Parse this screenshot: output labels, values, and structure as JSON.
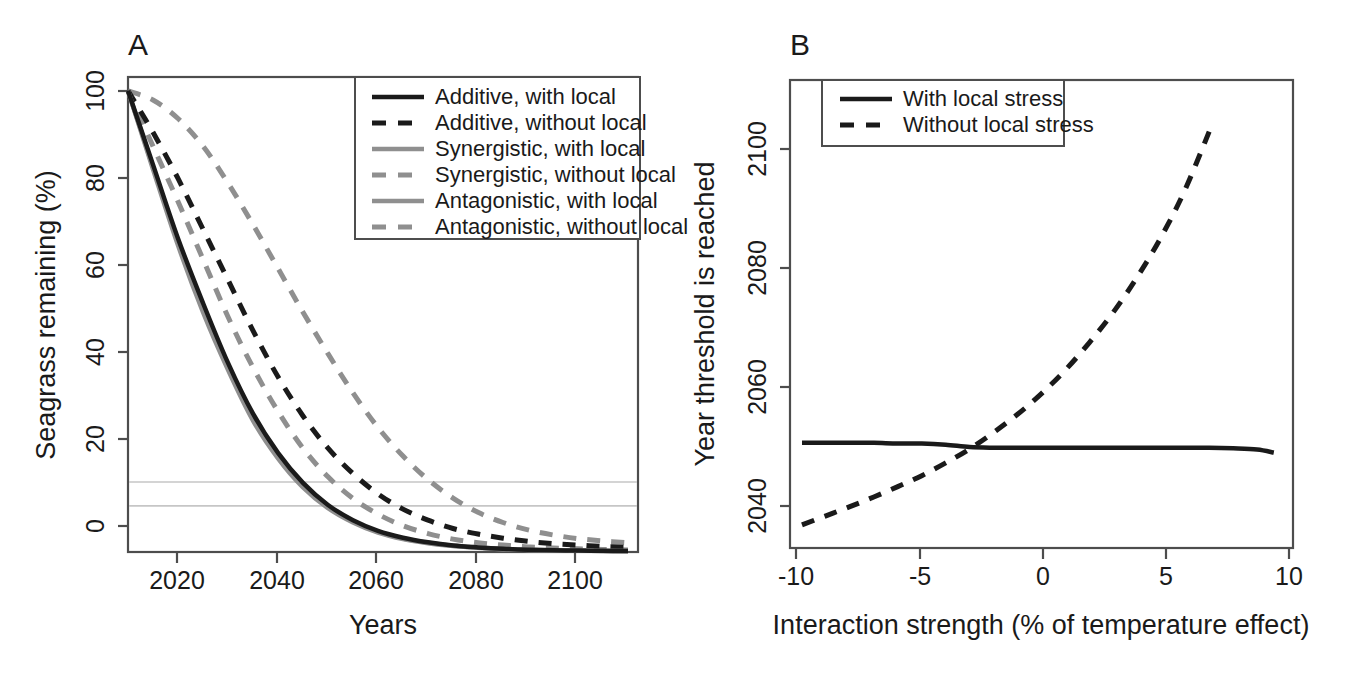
{
  "figure": {
    "background": "#ffffff",
    "colors": {
      "black": "#1a1a1a",
      "gray_dark": "#6e6e6e",
      "gray_light": "#8f8f8f",
      "axis": "#4d4d4d",
      "threshold_line": "#c6c6c6"
    }
  },
  "panelA": {
    "label": "A",
    "xlabel": "Years",
    "ylabel": "Seagrass remaining (%)",
    "xticks": [
      "2020",
      "2040",
      "2060",
      "2080",
      "2100"
    ],
    "yticks": [
      "0",
      "20",
      "40",
      "60",
      "80",
      "100"
    ],
    "legend": {
      "items": [
        {
          "label": "Additive, with local",
          "style": "solid",
          "color": "#1a1a1a"
        },
        {
          "label": "Additive, without local",
          "style": "dashed",
          "color": "#1a1a1a"
        },
        {
          "label": "Synergistic, with local",
          "style": "solid",
          "color": "#8f8f8f"
        },
        {
          "label": "Synergistic, without local",
          "style": "dashed",
          "color": "#8f8f8f"
        },
        {
          "label": "Antagonistic, with local",
          "style": "solid",
          "color": "#8f8f8f"
        },
        {
          "label": "Antagonistic, without local",
          "style": "dashed",
          "color": "#8f8f8f"
        }
      ]
    },
    "threshold": {
      "value": 10,
      "label": "10% threshold"
    }
  },
  "panelB": {
    "label": "B",
    "xlabel": "Interaction strength (% of temperature effect)",
    "ylabel": "Year threshold is reached",
    "xticks": [
      "-10",
      "-5",
      "0",
      "5",
      "10"
    ],
    "yticks": [
      "2040",
      "2060",
      "2080",
      "2100"
    ],
    "legend": {
      "items": [
        {
          "label": "With local stress",
          "style": "solid",
          "color": "#1a1a1a"
        },
        {
          "label": "Without local stress",
          "style": "dashed",
          "color": "#1a1a1a"
        }
      ]
    }
  },
  "chart_data": [
    {
      "type": "line",
      "panel": "A",
      "title": "",
      "xlabel": "Years",
      "ylabel": "Seagrass remaining (%)",
      "xlim": [
        2010,
        2112
      ],
      "ylim": [
        0,
        103
      ],
      "xticks": [
        2020,
        2040,
        2060,
        2080,
        2100
      ],
      "yticks": [
        0,
        20,
        40,
        60,
        80,
        100
      ],
      "grid": false,
      "legend_position": "top-right",
      "annotations": [
        {
          "type": "hline",
          "y": 10,
          "color": "#c6c6c6",
          "label": "10% collapse threshold"
        }
      ],
      "x": [
        2010,
        2015,
        2020,
        2025,
        2030,
        2035,
        2040,
        2045,
        2050,
        2055,
        2060,
        2065,
        2070,
        2075,
        2080,
        2085,
        2090,
        2095,
        2100,
        2105,
        2110
      ],
      "series": [
        {
          "name": "Additive, with local",
          "style": "solid",
          "color": "#1a1a1a",
          "values": [
            100,
            84,
            68,
            54,
            41,
            30,
            21.5,
            15,
            10.2,
            6.9,
            4.6,
            3.1,
            2.1,
            1.4,
            1.0,
            0.7,
            0.5,
            0.4,
            0.3,
            0.25,
            0.2
          ]
        },
        {
          "name": "Additive, without local",
          "style": "dashed",
          "color": "#1a1a1a",
          "values": [
            100,
            91,
            81,
            70,
            59,
            48,
            38,
            29.5,
            22.5,
            17,
            12.6,
            9.3,
            6.9,
            5.1,
            3.9,
            3.0,
            2.3,
            1.8,
            1.5,
            1.2,
            1.0
          ]
        },
        {
          "name": "Synergistic, with local",
          "style": "solid",
          "color": "#8f8f8f",
          "values": [
            100,
            83,
            66.5,
            52,
            39.5,
            28.5,
            20.3,
            14,
            9.5,
            6.4,
            4.2,
            2.8,
            1.9,
            1.3,
            0.9,
            0.6,
            0.45,
            0.35,
            0.28,
            0.22,
            0.18
          ]
        },
        {
          "name": "Synergistic, without local",
          "style": "dashed",
          "color": "#8f8f8f",
          "values": [
            100,
            88,
            76,
            63.5,
            51,
            40,
            30.5,
            22.5,
            16.3,
            11.6,
            8.2,
            5.7,
            4.0,
            2.8,
            2.0,
            1.5,
            1.1,
            0.85,
            0.7,
            0.55,
            0.45
          ]
        },
        {
          "name": "Antagonistic, with local",
          "style": "solid",
          "color": "#8f8f8f",
          "values": [
            100,
            83.5,
            67.5,
            53,
            40.3,
            29.3,
            21,
            14.5,
            9.9,
            6.6,
            4.4,
            2.9,
            2.0,
            1.35,
            0.95,
            0.65,
            0.48,
            0.37,
            0.3,
            0.24,
            0.2
          ]
        },
        {
          "name": "Antagonistic, without local",
          "style": "dashed",
          "color": "#8f8f8f",
          "values": [
            100,
            98,
            94,
            88,
            80,
            71,
            61.5,
            52,
            43,
            34.5,
            27,
            20.8,
            15.7,
            11.7,
            8.6,
            6.4,
            4.8,
            3.7,
            2.9,
            2.4,
            2.0
          ]
        }
      ]
    },
    {
      "type": "line",
      "panel": "B",
      "title": "",
      "xlabel": "Interaction strength (% of temperature effect)",
      "ylabel": "Year threshold is reached",
      "xlim": [
        -10.5,
        10.5
      ],
      "ylim": [
        2033,
        2110
      ],
      "xticks": [
        -10,
        -5,
        0,
        5,
        10
      ],
      "yticks": [
        2040,
        2060,
        2080,
        2100
      ],
      "grid": false,
      "legend_position": "top-left",
      "x": [
        -10,
        -9,
        -8,
        -7,
        -6,
        -5,
        -4,
        -3,
        -2,
        -1,
        0,
        1,
        2,
        3,
        4,
        5,
        6,
        7,
        8,
        9,
        9.7
      ],
      "series": [
        {
          "name": "With local stress",
          "style": "solid",
          "color": "#1a1a1a",
          "values": [
            2050.3,
            2050.3,
            2050.3,
            2050.3,
            2050.2,
            2050.2,
            2050.0,
            2049.6,
            2049.5,
            2049.5,
            2049.5,
            2049.5,
            2049.5,
            2049.5,
            2049.5,
            2049.5,
            2049.5,
            2049.5,
            2049.4,
            2049.2,
            2048.7
          ]
        },
        {
          "name": "Without local stress",
          "style": "dashed",
          "color": "#1a1a1a",
          "values": [
            2036.8,
            2038.3,
            2039.8,
            2041.4,
            2043.1,
            2044.9,
            2047.0,
            2049.3,
            2052.0,
            2055.0,
            2058.4,
            2062.3,
            2066.8,
            2071.8,
            2077.6,
            2084.2,
            2092.0,
            2101.5,
            null,
            null,
            null
          ]
        }
      ]
    }
  ]
}
